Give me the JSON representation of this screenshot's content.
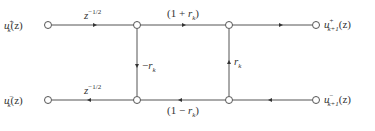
{
  "diagram": {
    "type": "lattice-filter-section-signal-flow-graph",
    "nodes": {
      "input_top": {
        "label_var": "u",
        "sub": "k",
        "sup": "+",
        "arg": "(z)"
      },
      "input_bottom": {
        "label_var": "u",
        "sub": "k",
        "sup": "−",
        "arg": "(z)"
      },
      "output_top": {
        "label_var": "u",
        "sub": "k+1",
        "sup": "+",
        "arg": "(z)"
      },
      "output_bottom": {
        "label_var": "u",
        "sub": "k+1",
        "sup": "−",
        "arg": "(z)"
      }
    },
    "branches": {
      "top_delay": {
        "base": "z",
        "exp": "−1/2"
      },
      "bottom_delay": {
        "base": "z",
        "exp": "−1/2"
      },
      "top_gain": {
        "open": "(1 + ",
        "var": "r",
        "sub": "k",
        "close": ")"
      },
      "bottom_gain": {
        "open": "(1 − ",
        "var": "r",
        "sub": "k",
        "close": ")"
      },
      "left_vertical": {
        "sign": "−",
        "var": "r",
        "sub": "k"
      },
      "right_vertical": {
        "var": "r",
        "sub": "k"
      }
    },
    "colors": {
      "line": "#555555",
      "text": "#333333",
      "node_fill": "#ffffff"
    }
  }
}
